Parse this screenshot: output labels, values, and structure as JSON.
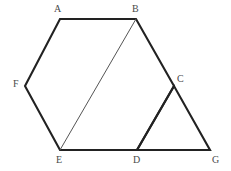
{
  "figure": {
    "canvas": {
      "width": 231,
      "height": 171,
      "background": "#ffffff"
    },
    "colors": {
      "outline": "#222222",
      "diagonal": "#555555",
      "label": "#4a4a4a"
    },
    "vertices": [
      {
        "id": "A",
        "label": "A",
        "x": 60,
        "y": 19,
        "label_x": 54,
        "label_y": 4
      },
      {
        "id": "B",
        "label": "B",
        "x": 136,
        "y": 19,
        "label_x": 132,
        "label_y": 4
      },
      {
        "id": "C",
        "label": "C",
        "x": 174,
        "y": 86,
        "label_x": 177,
        "label_y": 74
      },
      {
        "id": "D",
        "label": "D",
        "x": 137,
        "y": 150,
        "label_x": 133,
        "label_y": 155
      },
      {
        "id": "E",
        "label": "E",
        "x": 60,
        "y": 150,
        "label_x": 56,
        "label_y": 155
      },
      {
        "id": "F",
        "label": "F",
        "x": 25,
        "y": 86,
        "label_x": 13,
        "label_y": 79
      },
      {
        "id": "G",
        "label": "G",
        "x": 210,
        "y": 150,
        "label_x": 212,
        "label_y": 155
      }
    ],
    "edges": [
      {
        "name": "edge-AB",
        "from": "A",
        "to": "B",
        "weight": "thick"
      },
      {
        "name": "edge-BC",
        "from": "B",
        "to": "C",
        "weight": "thick"
      },
      {
        "name": "edge-CD",
        "from": "C",
        "to": "D",
        "weight": "thick"
      },
      {
        "name": "edge-DE",
        "from": "D",
        "to": "E",
        "weight": "thick"
      },
      {
        "name": "edge-EF",
        "from": "E",
        "to": "F",
        "weight": "thick"
      },
      {
        "name": "edge-FA",
        "from": "F",
        "to": "A",
        "weight": "thick"
      },
      {
        "name": "edge-DG",
        "from": "D",
        "to": "G",
        "weight": "thick"
      },
      {
        "name": "edge-CG",
        "from": "C",
        "to": "G",
        "weight": "thick"
      },
      {
        "name": "edge-BE",
        "from": "B",
        "to": "E",
        "weight": "thin"
      }
    ],
    "paths": {
      "hexagon": "M 60 19 L 136 19 L 174 86 L 137 150 L 60 150 L 25 86 Z",
      "triangle_cdg": "M 174 86 L 137 150 L 210 150 Z",
      "diagonal_be": "M 136 19 L 60 150"
    }
  }
}
